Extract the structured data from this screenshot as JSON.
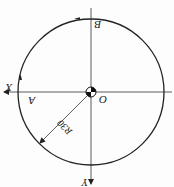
{
  "diagram": {
    "orientation": "rotated-180",
    "circle": {
      "center": [
        91,
        92
      ],
      "radius": 73,
      "stroke": "#222222"
    },
    "labels": {
      "x_axis": "X",
      "y_axis": "Y",
      "origin": "O",
      "point_a": "A",
      "point_b": "B",
      "radius_dim": "R30"
    },
    "colors": {
      "line": "#222222",
      "background": "#fdfdfd"
    }
  }
}
